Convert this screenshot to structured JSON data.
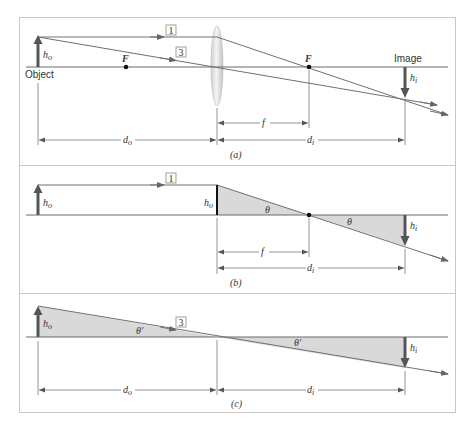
{
  "panels": {
    "a": {
      "caption": "(a)",
      "ray1_label": "1",
      "ray3_label": "3",
      "object_label": "Object",
      "image_label": "Image",
      "h_o": "h",
      "h_o_sub": "o",
      "h_i": "h",
      "h_i_sub": "i",
      "focal_left": "F",
      "focal_right": "F",
      "d_o": "d",
      "d_o_sub": "o",
      "d_i": "d",
      "d_i_sub": "i",
      "f": "f"
    },
    "b": {
      "caption": "(b)",
      "ray1_label": "1",
      "h_o_left": "h",
      "h_o_left_sub": "o",
      "h_o_lens": "h",
      "h_o_lens_sub": "o",
      "h_i": "h",
      "h_i_sub": "i",
      "theta_left": "θ",
      "theta_right": "θ",
      "f": "f",
      "d_i": "d",
      "d_i_sub": "i"
    },
    "c": {
      "caption": "(c)",
      "ray3_label": "3",
      "h_o": "h",
      "h_o_sub": "o",
      "h_i": "h",
      "h_i_sub": "i",
      "theta_left": "θ′",
      "theta_right": "θ′",
      "d_o": "d",
      "d_o_sub": "o",
      "d_i": "d",
      "d_i_sub": "i"
    }
  },
  "colors": {
    "arrow": "#555555",
    "shade": "#d9d9d9",
    "frame": "#c8c8c8"
  }
}
